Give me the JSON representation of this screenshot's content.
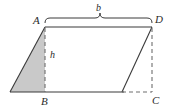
{
  "figure": {
    "name": "parallelogram-area-diagram",
    "labels": {
      "vertex_a": "A",
      "vertex_b": "B",
      "vertex_c": "C",
      "vertex_d": "D",
      "base": "b",
      "height": "h"
    },
    "colors": {
      "background": "#ffffff",
      "shaded_fill": "#c9c9c9",
      "stroke": "#3a3a3a",
      "dashed_stroke": "#6e6e6e",
      "text": "#2b2b2b"
    },
    "geometry": {
      "parallelogram_points": "45,27 152,27 152,92 45,92",
      "left_triangle_points": "10,92 45,27 45,92",
      "right_triangle_points": "122,92 152,27 152,92",
      "top_edge": {
        "x1": 45,
        "y1": 27,
        "x2": 152,
        "y2": 27
      },
      "bottom_edge": {
        "x1": 10,
        "y1": 92,
        "x2": 152,
        "y2": 92
      },
      "left_slant": {
        "x1": 10,
        "y1": 92,
        "x2": 45,
        "y2": 27
      },
      "right_slant": {
        "x1": 122,
        "y1": 92,
        "x2": 152,
        "y2": 27
      },
      "height_line": {
        "x1": 45,
        "y1": 27,
        "x2": 45,
        "y2": 92
      },
      "right_vertical_dashed": {
        "x1": 152,
        "y1": 27,
        "x2": 152,
        "y2": 92
      },
      "bottom_dashed": {
        "x1": 122,
        "y1": 92,
        "x2": 152,
        "y2": 92
      },
      "brace": {
        "x_start": 45,
        "x_end": 152,
        "y": 18,
        "tip_x": 100
      }
    }
  }
}
